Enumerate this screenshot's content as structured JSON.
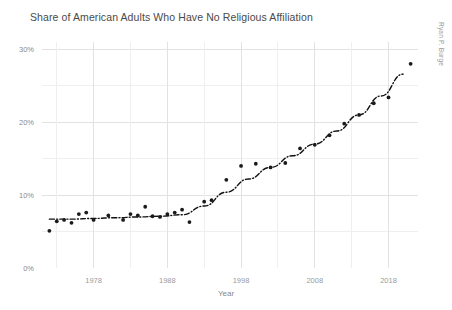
{
  "chart_data": {
    "type": "scatter",
    "title": "Share of American Adults Who Have No Religious Affiliation",
    "xlabel": "Year",
    "ylabel": "",
    "credit": "Ryan P. Burge",
    "xlim": [
      1971,
      2022
    ],
    "ylim": [
      0,
      31
    ],
    "grid": true,
    "legend": "none",
    "x_ticks": [
      1978,
      1988,
      1998,
      2008,
      2018
    ],
    "x_tick_labels": [
      "1978",
      "1988",
      "1998",
      "2008",
      "2018"
    ],
    "x_minor_ticks": [
      1973,
      1983,
      1993,
      2003,
      2013
    ],
    "y_ticks": [
      0,
      10,
      20,
      30
    ],
    "y_tick_labels": [
      "0%",
      "10%",
      "20%",
      "30%"
    ],
    "y_minor_ticks": [
      5,
      15,
      25
    ],
    "series": [
      {
        "name": "No Religious Affiliation",
        "marker": "dot",
        "color": "#1a1a1a",
        "x": [
          1972,
          1973,
          1974,
          1975,
          1976,
          1977,
          1978,
          1980,
          1982,
          1983,
          1984,
          1985,
          1986,
          1987,
          1988,
          1989,
          1990,
          1991,
          1993,
          1994,
          1996,
          1998,
          2000,
          2002,
          2004,
          2006,
          2008,
          2010,
          2012,
          2014,
          2016,
          2018,
          2021
        ],
        "y": [
          5.1,
          6.4,
          6.6,
          6.2,
          7.4,
          7.6,
          6.6,
          7.2,
          6.6,
          7.4,
          7.2,
          8.4,
          7.1,
          7.0,
          7.4,
          7.6,
          8.0,
          6.3,
          9.1,
          9.3,
          12.1,
          14.0,
          14.3,
          13.8,
          14.4,
          16.4,
          16.9,
          18.2,
          19.8,
          21.0,
          22.6,
          23.4,
          28.0
        ]
      },
      {
        "name": "Fitted trend (loess)",
        "style": "dash-dot",
        "color": "#111111",
        "x": [
          1972,
          1975,
          1978,
          1981,
          1984,
          1987,
          1990,
          1993,
          1996,
          1999,
          2002,
          2005,
          2008,
          2011,
          2014,
          2017,
          2020
        ],
        "y": [
          6.7,
          6.7,
          6.8,
          6.9,
          7.0,
          7.1,
          7.3,
          8.5,
          10.4,
          12.2,
          13.8,
          15.4,
          17.0,
          18.8,
          21.0,
          23.6,
          26.6
        ]
      }
    ]
  }
}
